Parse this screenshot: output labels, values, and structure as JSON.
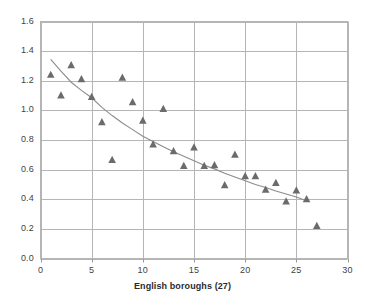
{
  "chart_data": {
    "type": "scatter",
    "title": "",
    "xlabel": "English boroughs (27)",
    "ylabel": "",
    "xlim": [
      0,
      30
    ],
    "ylim": [
      0.0,
      1.6
    ],
    "xticks": [
      "0",
      "5",
      "10",
      "15",
      "20",
      "25",
      "30"
    ],
    "xtick_values": [
      0,
      5,
      10,
      15,
      20,
      25,
      30
    ],
    "yticks": [
      "0.0",
      "0.2",
      "0.4",
      "0.6",
      "0.8",
      "1.0",
      "1.2",
      "1.4",
      "1.6"
    ],
    "ytick_values": [
      0.0,
      0.2,
      0.4,
      0.6,
      0.8,
      1.0,
      1.2,
      1.4,
      1.6
    ],
    "grid": true,
    "legend": false,
    "marker": "triangle",
    "marker_color": "#6b6b6b",
    "trendline_color": "#8c8c8c",
    "gridline_color": "#b5b5b5",
    "x": [
      1,
      2,
      3,
      4,
      5,
      6,
      7,
      8,
      9,
      10,
      11,
      12,
      13,
      14,
      15,
      16,
      17,
      18,
      19,
      20,
      21,
      22,
      23,
      24,
      25,
      26,
      27
    ],
    "values": [
      1.24,
      1.1,
      1.305,
      1.21,
      1.09,
      0.92,
      0.665,
      1.22,
      1.055,
      0.93,
      0.77,
      1.01,
      0.725,
      0.625,
      0.75,
      0.625,
      0.63,
      0.495,
      0.7,
      0.555,
      0.555,
      0.465,
      0.51,
      0.385,
      0.46,
      0.4,
      0.22
    ],
    "series": [
      {
        "name": "English boroughs",
        "type": "scatter",
        "x": [
          1,
          2,
          3,
          4,
          5,
          6,
          7,
          8,
          9,
          10,
          11,
          12,
          13,
          14,
          15,
          16,
          17,
          18,
          19,
          20,
          21,
          22,
          23,
          24,
          25,
          26,
          27
        ],
        "values": [
          1.24,
          1.1,
          1.305,
          1.21,
          1.09,
          0.92,
          0.665,
          1.22,
          1.055,
          0.93,
          0.77,
          1.01,
          0.725,
          0.625,
          0.75,
          0.625,
          0.63,
          0.495,
          0.7,
          0.555,
          0.555,
          0.465,
          0.51,
          0.385,
          0.46,
          0.4,
          0.22
        ]
      },
      {
        "name": "trendline",
        "type": "line",
        "x": [
          1,
          2,
          3,
          4,
          5,
          6,
          7,
          8,
          9,
          10,
          11,
          12,
          13,
          14,
          15,
          16,
          17,
          18,
          19,
          20,
          21,
          22,
          23,
          24,
          25,
          26
        ],
        "values": [
          1.345,
          1.265,
          1.19,
          1.135,
          1.085,
          1.02,
          0.965,
          0.915,
          0.87,
          0.825,
          0.79,
          0.755,
          0.72,
          0.69,
          0.66,
          0.63,
          0.605,
          0.575,
          0.55,
          0.525,
          0.5,
          0.48,
          0.455,
          0.435,
          0.415,
          0.39
        ]
      }
    ]
  }
}
